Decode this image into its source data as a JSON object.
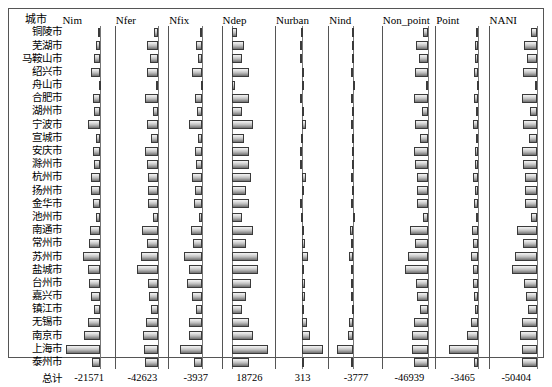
{
  "chart_data": {
    "type": "bar",
    "title": "",
    "subtitle": "",
    "xlabel": "",
    "ylabel": "",
    "orientation": "horizontal",
    "layout": "small-multiples-panel-grid",
    "grid": false,
    "legend": "none",
    "row_header": "城市",
    "total_label": "总计",
    "categories": [
      "铜陵市",
      "芜湖市",
      "马鞍山市",
      "绍兴市",
      "舟山市",
      "合肥市",
      "湖州市",
      "宁波市",
      "宣城市",
      "安庆市",
      "滁州市",
      "杭州市",
      "扬州市",
      "金华市",
      "池州市",
      "南通市",
      "常州市",
      "苏州市",
      "盐城市",
      "台州市",
      "嘉兴市",
      "镇江市",
      "无锡市",
      "南京市",
      "上海市",
      "泰州市"
    ],
    "series": [
      {
        "name": "Nim",
        "total": "-21571",
        "axis_frac": 0.72,
        "max_abs": 6000,
        "values": [
          -300,
          -700,
          -900,
          -1500,
          -250,
          -1150,
          -900,
          -2000,
          -700,
          -1100,
          -1000,
          -1500,
          -1400,
          -1150,
          -600,
          -1600,
          -1700,
          -2700,
          -1900,
          -1700,
          -1400,
          -900,
          -2000,
          -2500,
          -5400,
          -1300
        ]
      },
      {
        "name": "Nfer",
        "total": "-42623",
        "axis_frac": 0.8,
        "max_abs": 9000,
        "values": [
          -900,
          -2300,
          -1700,
          -2300,
          -300,
          -2700,
          -1100,
          -2200,
          -1400,
          -2700,
          -2300,
          -2000,
          -2100,
          -2000,
          -1000,
          -3400,
          -2300,
          -3600,
          -4400,
          -2100,
          -1900,
          -1500,
          -2600,
          -3100,
          -3000,
          -2700
        ]
      },
      {
        "name": "Nfix",
        "total": "-3937",
        "axis_frac": 0.62,
        "max_abs": 2400,
        "values": [
          -120,
          -400,
          -250,
          -700,
          -60,
          -500,
          -350,
          -950,
          -300,
          -500,
          -450,
          -700,
          -500,
          -600,
          -200,
          -800,
          -650,
          -1300,
          -900,
          -1100,
          -700,
          -400,
          -900,
          -900,
          -1600,
          -600
        ]
      },
      {
        "name": "Ndep",
        "total": "18726",
        "axis_frac": 0.18,
        "max_abs": 1800,
        "values": [
          200,
          500,
          400,
          700,
          120,
          700,
          400,
          900,
          500,
          700,
          700,
          800,
          600,
          700,
          400,
          900,
          600,
          1100,
          1100,
          800,
          600,
          400,
          700,
          900,
          1500,
          700
        ]
      },
      {
        "name": "Nurban",
        "total": "313",
        "axis_frac": 0.5,
        "max_abs": 900,
        "values": [
          -40,
          -60,
          -60,
          60,
          -20,
          -80,
          40,
          120,
          -40,
          -60,
          -60,
          140,
          60,
          -60,
          -30,
          80,
          100,
          200,
          80,
          100,
          90,
          60,
          150,
          260,
          700,
          80
        ]
      },
      {
        "name": "Nind",
        "total": "-3777",
        "axis_frac": 0.46,
        "max_abs": 1400,
        "values": [
          -60,
          -110,
          -90,
          -120,
          -30,
          -140,
          -70,
          -150,
          -60,
          -110,
          -90,
          -160,
          -110,
          -120,
          -50,
          -180,
          -170,
          -230,
          -160,
          -170,
          -140,
          -90,
          -230,
          -330,
          -950,
          -130
        ]
      },
      {
        "name": "Non_point",
        "total": "-46939",
        "axis_frac": 0.86,
        "max_abs": 9500,
        "values": [
          -1000,
          -2500,
          -1900,
          -2600,
          -350,
          -3000,
          -1300,
          -2600,
          -1600,
          -3000,
          -2600,
          -2300,
          -2300,
          -2300,
          -1100,
          -3800,
          -2600,
          -4200,
          -4900,
          -2500,
          -2200,
          -1700,
          -3000,
          -3400,
          -3300,
          -3000
        ]
      },
      {
        "name": "Point",
        "total": "-3465",
        "axis_frac": 0.8,
        "max_abs": 1500,
        "values": [
          -70,
          -120,
          -100,
          -140,
          -30,
          -150,
          -80,
          -170,
          -70,
          -120,
          -100,
          -180,
          -120,
          -140,
          -60,
          -200,
          -190,
          -260,
          -180,
          -190,
          -160,
          -100,
          -260,
          -380,
          -1050,
          -150
        ]
      },
      {
        "name": "NANI",
        "total": "-50404",
        "axis_frac": 0.88,
        "max_abs": 10000,
        "values": [
          -1100,
          -2700,
          -2100,
          -2800,
          -400,
          -3200,
          -1400,
          -2900,
          -1700,
          -3200,
          -2800,
          -2500,
          -2500,
          -2500,
          -1200,
          -4100,
          -2800,
          -4500,
          -5200,
          -2700,
          -2300,
          -1800,
          -3200,
          -3500,
          -3000,
          -3200
        ]
      }
    ]
  }
}
